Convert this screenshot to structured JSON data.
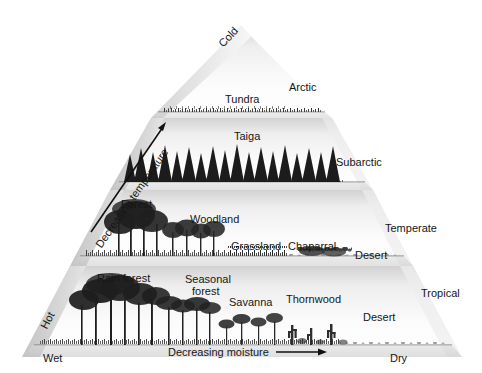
{
  "figure": {
    "type": "biome-climate-pyramid",
    "background_color": "#ffffff",
    "ink_color": "#161616",
    "pyramid_fill_light": "#f7f7f7",
    "pyramid_fill_shadow": "#c9c9c9"
  },
  "axes": {
    "vertical": {
      "label": "Decreasing temperature",
      "low_end": "Hot",
      "high_end": "Cold",
      "arrow": "up-right-arrow"
    },
    "horizontal": {
      "label": "Decreasing moisture",
      "low_end": "Wet",
      "high_end": "Dry",
      "arrow": "right-arrow"
    }
  },
  "tiers": [
    {
      "zone": "Arctic",
      "biomes": [
        "Tundra"
      ]
    },
    {
      "zone": "Subarctic",
      "biomes": [
        "Taiga"
      ]
    },
    {
      "zone": "Temperate",
      "biomes": [
        "Forest",
        "Woodland",
        "Grassland",
        "Chaparral",
        "Desert"
      ]
    },
    {
      "zone": "Tropical",
      "biomes": [
        "Rain forest",
        "Seasonal forest",
        "Savanna",
        "Thornwood",
        "Desert"
      ]
    }
  ],
  "labels": {
    "cold": "Cold",
    "hot": "Hot",
    "wet": "Wet",
    "dry": "Dry",
    "decreasing_temperature": "Decreasing temperature",
    "decreasing_moisture": "Decreasing moisture",
    "arctic": "Arctic",
    "subarctic": "Subarctic",
    "temperate": "Temperate",
    "tropical": "Tropical",
    "tundra": "Tundra",
    "taiga": "Taiga",
    "forest": "Forest",
    "woodland": "Woodland",
    "grassland": "Grassland",
    "chaparral": "Chaparral",
    "desert_temperate": "Desert",
    "rain_forest": "Rain forest",
    "seasonal_forest_l1": "Seasonal",
    "seasonal_forest_l2": "forest",
    "savanna": "Savanna",
    "thornwood": "Thornwood",
    "desert_tropical": "Desert"
  }
}
